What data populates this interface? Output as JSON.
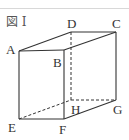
{
  "figure": {
    "caption": "図 I",
    "type": "rectangular prism (cuboid) in oblique projection",
    "line_color": "#333333",
    "vertices": {
      "A": {
        "label": "A",
        "x": 19,
        "y": 51
      },
      "B": {
        "label": "B",
        "x": 64,
        "y": 50
      },
      "C": {
        "label": "C",
        "x": 116,
        "y": 32
      },
      "D": {
        "label": "D",
        "x": 71,
        "y": 32
      },
      "E": {
        "label": "E",
        "x": 19,
        "y": 119
      },
      "F": {
        "label": "F",
        "x": 64,
        "y": 119
      },
      "G": {
        "label": "G",
        "x": 116,
        "y": 100
      },
      "H": {
        "label": "H",
        "x": 71,
        "y": 100
      }
    },
    "solid_edges": [
      "AB",
      "BC",
      "CD",
      "DA",
      "AE",
      "BF",
      "CG",
      "EF",
      "FG"
    ],
    "hidden_edges": [
      "DH",
      "EH",
      "HG"
    ]
  }
}
